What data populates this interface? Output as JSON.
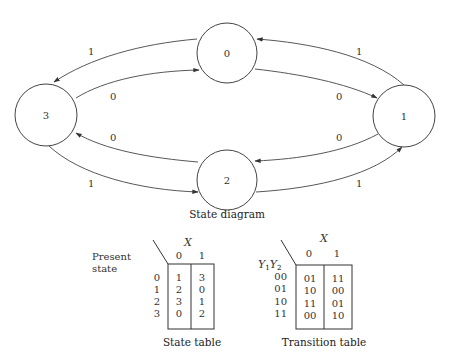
{
  "state_diagram": {
    "caption": "State diagram",
    "states": [
      {
        "id": "0",
        "label": "0"
      },
      {
        "id": "1",
        "label": "1"
      },
      {
        "id": "2",
        "label": "2"
      },
      {
        "id": "3",
        "label": "3"
      }
    ],
    "transitions": [
      {
        "from": "0",
        "to": "3",
        "input": "1"
      },
      {
        "from": "3",
        "to": "0",
        "input": "0"
      },
      {
        "from": "0",
        "to": "1",
        "input": "0"
      },
      {
        "from": "1",
        "to": "0",
        "input": "1"
      },
      {
        "from": "1",
        "to": "2",
        "input": "0"
      },
      {
        "from": "2",
        "to": "1",
        "input": "1"
      },
      {
        "from": "2",
        "to": "3",
        "input": "0"
      },
      {
        "from": "3",
        "to": "2",
        "input": "1"
      }
    ]
  },
  "state_table": {
    "caption": "State table",
    "row_header_line1": "Present",
    "row_header_line2": "state",
    "column_header": "X",
    "columns": [
      "0",
      "1"
    ],
    "rows": [
      {
        "state": "0",
        "next": [
          "1",
          "3"
        ]
      },
      {
        "state": "1",
        "next": [
          "2",
          "0"
        ]
      },
      {
        "state": "2",
        "next": [
          "3",
          "1"
        ]
      },
      {
        "state": "3",
        "next": [
          "0",
          "2"
        ]
      }
    ]
  },
  "transition_table": {
    "caption": "Transition table",
    "row_header_main": "Y",
    "row_header_sub1": "1",
    "row_header_sub2": "2",
    "column_header": "X",
    "columns": [
      "0",
      "1"
    ],
    "rows": [
      {
        "code": "00",
        "next": [
          "01",
          "11"
        ]
      },
      {
        "code": "01",
        "next": [
          "10",
          "00"
        ]
      },
      {
        "code": "10",
        "next": [
          "11",
          "01"
        ]
      },
      {
        "code": "11",
        "next": [
          "00",
          "10"
        ]
      }
    ]
  }
}
